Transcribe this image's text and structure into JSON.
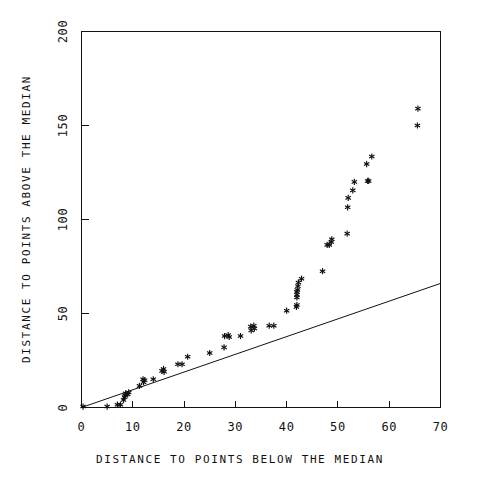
{
  "chart_data": {
    "type": "scatter",
    "title": "",
    "subtitle": "",
    "xlabel": "DISTANCE TO POINTS BELOW THE MEDIAN",
    "ylabel": "DISTANCE TO POINTS ABOVE THE MEDIAN",
    "xlim": [
      0,
      70
    ],
    "ylim": [
      0,
      200
    ],
    "xticks": [
      0,
      10,
      20,
      30,
      40,
      50,
      60,
      70
    ],
    "xticklabels": [
      "0",
      "10",
      "20",
      "30",
      "40",
      "50",
      "60",
      "70"
    ],
    "yticks": [
      0,
      50,
      100,
      150,
      200
    ],
    "yticklabels": [
      "0",
      "50",
      "100",
      "150",
      "200"
    ],
    "grid": false,
    "legend": null,
    "marker_symbol": "asterisk",
    "marker_color": "#111111",
    "frame_color": "#111111",
    "background_color": "#ffffff",
    "annotations": [],
    "series": [
      {
        "name": "observations",
        "type": "scatter",
        "points": [
          [
            0.3,
            0.5
          ],
          [
            5.0,
            0.5
          ],
          [
            7.0,
            1.5
          ],
          [
            7.6,
            1.5
          ],
          [
            8.2,
            4.0
          ],
          [
            8.4,
            5.5
          ],
          [
            8.5,
            6.5
          ],
          [
            8.6,
            7.5
          ],
          [
            9.0,
            7.0
          ],
          [
            9.2,
            8.0
          ],
          [
            11.3,
            11.5
          ],
          [
            12.0,
            15.0
          ],
          [
            12.1,
            13.5
          ],
          [
            12.3,
            14.5
          ],
          [
            14.0,
            15.0
          ],
          [
            15.7,
            19.5
          ],
          [
            16.0,
            20.5
          ],
          [
            16.1,
            19.0
          ],
          [
            18.8,
            23.0
          ],
          [
            19.6,
            23.0
          ],
          [
            20.7,
            27.0
          ],
          [
            25.0,
            29.0
          ],
          [
            27.8,
            32.0
          ],
          [
            27.9,
            38.0
          ],
          [
            28.6,
            38.5
          ],
          [
            28.8,
            37.5
          ],
          [
            31.0,
            38.0
          ],
          [
            33.0,
            43.0
          ],
          [
            33.1,
            41.0
          ],
          [
            33.6,
            43.5
          ],
          [
            33.7,
            42.0
          ],
          [
            36.6,
            43.5
          ],
          [
            37.5,
            43.5
          ],
          [
            40.0,
            51.5
          ],
          [
            41.9,
            53.5
          ],
          [
            42.0,
            54.5
          ],
          [
            42.0,
            58.5
          ],
          [
            42.0,
            60.0
          ],
          [
            42.0,
            61.5
          ],
          [
            42.1,
            62.5
          ],
          [
            42.2,
            64.5
          ],
          [
            42.3,
            66.5
          ],
          [
            42.9,
            68.5
          ],
          [
            47.0,
            72.5
          ],
          [
            47.9,
            86.5
          ],
          [
            48.3,
            86.5
          ],
          [
            48.7,
            88.0
          ],
          [
            48.8,
            89.5
          ],
          [
            51.8,
            92.5
          ],
          [
            51.9,
            106.5
          ],
          [
            52.0,
            111.5
          ],
          [
            52.9,
            115.5
          ],
          [
            53.2,
            120.0
          ],
          [
            55.8,
            120.5
          ],
          [
            56.0,
            120.5
          ],
          [
            55.6,
            129.5
          ],
          [
            56.6,
            133.5
          ],
          [
            65.6,
            159.0
          ],
          [
            65.5,
            150.0
          ]
        ]
      },
      {
        "name": "reference-line",
        "type": "line",
        "points": [
          [
            0,
            0
          ],
          [
            70,
            66
          ]
        ]
      }
    ]
  },
  "figure": {
    "alt": "Scatter plot of distance to points above the median versus distance to points below the median with a straight reference line"
  }
}
